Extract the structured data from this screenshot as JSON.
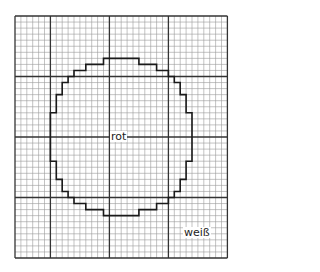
{
  "diagram": {
    "type": "grid-pattern",
    "grid": {
      "origin_x": 15,
      "origin_y": 16,
      "cols": 36,
      "rows": 40,
      "cell_w": 5.9,
      "cell_h": 6.05,
      "major_cols": [
        0,
        6,
        16,
        26,
        36
      ],
      "major_rows": [
        0,
        10,
        20,
        30,
        40
      ],
      "minor_color": "#9a9a9a",
      "major_color": "#333333",
      "shape_color": "#1a1a1a"
    },
    "shape": {
      "name": "circle-outline",
      "points": [
        [
          15,
          7
        ],
        [
          21,
          7
        ],
        [
          21,
          8
        ],
        [
          24,
          8
        ],
        [
          24,
          9
        ],
        [
          26,
          9
        ],
        [
          26,
          10
        ],
        [
          27,
          10
        ],
        [
          27,
          11
        ],
        [
          28,
          11
        ],
        [
          28,
          13
        ],
        [
          29,
          13
        ],
        [
          29,
          16
        ],
        [
          30,
          16
        ],
        [
          30,
          24
        ],
        [
          29,
          24
        ],
        [
          29,
          27
        ],
        [
          28,
          27
        ],
        [
          28,
          29
        ],
        [
          27,
          29
        ],
        [
          27,
          30
        ],
        [
          26,
          30
        ],
        [
          26,
          31
        ],
        [
          24,
          31
        ],
        [
          24,
          32
        ],
        [
          21,
          32
        ],
        [
          21,
          33
        ],
        [
          15,
          33
        ],
        [
          15,
          32
        ],
        [
          12,
          32
        ],
        [
          12,
          31
        ],
        [
          10,
          31
        ],
        [
          10,
          30
        ],
        [
          9,
          30
        ],
        [
          9,
          29
        ],
        [
          8,
          29
        ],
        [
          8,
          27
        ],
        [
          7,
          27
        ],
        [
          7,
          24
        ],
        [
          6,
          24
        ],
        [
          6,
          16
        ],
        [
          7,
          16
        ],
        [
          7,
          13
        ],
        [
          8,
          13
        ],
        [
          8,
          11
        ],
        [
          9,
          11
        ],
        [
          9,
          10
        ],
        [
          10,
          10
        ],
        [
          10,
          9
        ],
        [
          12,
          9
        ],
        [
          12,
          8
        ],
        [
          15,
          8
        ]
      ]
    },
    "labels": {
      "inside": "rot",
      "outside": "weiß"
    }
  }
}
